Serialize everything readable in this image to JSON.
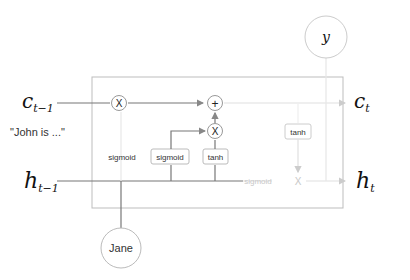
{
  "diagram": {
    "type": "lstm-cell",
    "inputs": {
      "cell_prev": "c",
      "cell_prev_sub": "t−1",
      "hidden_prev": "h",
      "hidden_prev_sub": "t−1",
      "context_note": "\"John is ...\""
    },
    "outputs": {
      "cell": "c",
      "cell_sub": "t",
      "hidden": "h",
      "hidden_sub": "t",
      "y": "y"
    },
    "input_node": "Jane",
    "gates": {
      "forget_label": "sigmoid",
      "input_gate_label": "sigmoid",
      "candidate_label": "tanh",
      "output_tanh_label": "tanh",
      "output_gate_label": "sigmoid"
    },
    "ops": {
      "multiply": "X",
      "add": "+"
    }
  }
}
